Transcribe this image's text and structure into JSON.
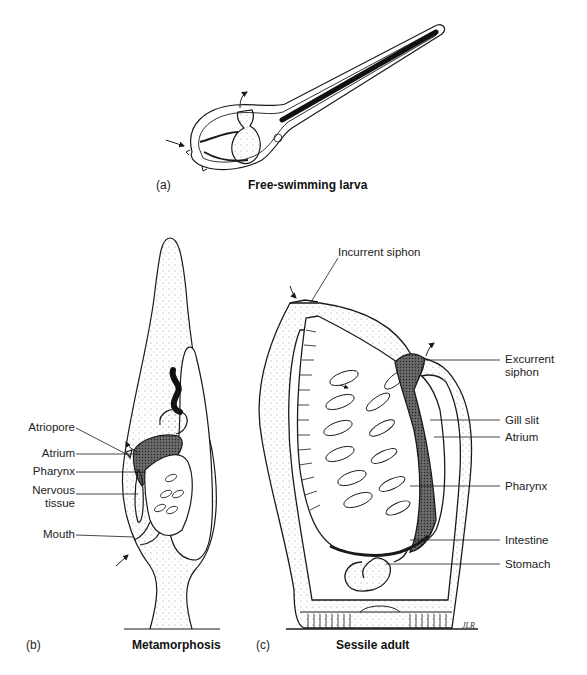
{
  "figure": {
    "panels": [
      {
        "id": "a",
        "letter": "(a)",
        "caption": "Free-swimming larva",
        "labels": []
      },
      {
        "id": "b",
        "letter": "(b)",
        "caption": "Metamorphosis",
        "labels": [
          {
            "text": "Atriopore"
          },
          {
            "text": "Atrium"
          },
          {
            "text": "Pharynx"
          },
          {
            "text": "Nervous tissue",
            "line1": "Nervous",
            "line2": "tissue"
          },
          {
            "text": "Mouth"
          }
        ]
      },
      {
        "id": "c",
        "letter": "(c)",
        "caption": "Sessile adult",
        "labels": [
          {
            "text": "Incurrent siphon"
          },
          {
            "text": "Excurrent siphon",
            "line1": "Excurrent",
            "line2": "siphon"
          },
          {
            "text": "Gill slit"
          },
          {
            "text": "Atrium"
          },
          {
            "text": "Pharynx"
          },
          {
            "text": "Intestine"
          },
          {
            "text": "Stomach"
          }
        ],
        "signature": "JLR"
      }
    ],
    "colors": {
      "ink": "#1a1a1a",
      "stipple": "#8a8a8a",
      "background": "#ffffff"
    }
  }
}
